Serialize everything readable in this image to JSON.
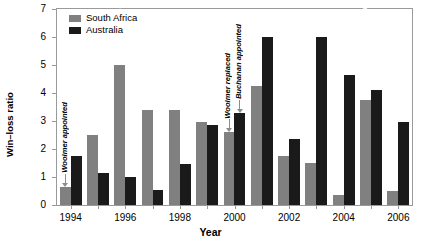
{
  "chart_data": {
    "type": "bar",
    "title": "",
    "xlabel": "Year",
    "ylabel": "Win–loss ratio",
    "ylim": [
      0,
      7
    ],
    "yticks": [
      0,
      1,
      2,
      3,
      4,
      5,
      6,
      7
    ],
    "grid": false,
    "legend_position": "top-left",
    "categories": [
      1994,
      1995,
      1996,
      1997,
      1998,
      1999,
      2000,
      2001,
      2002,
      2003,
      2004,
      2005,
      2006
    ],
    "xtick_labels": [
      "1994",
      "1996",
      "1998",
      "2000",
      "2002",
      "2004",
      "2006"
    ],
    "xtick_categories": [
      1994,
      1996,
      1998,
      2000,
      2002,
      2004,
      2006
    ],
    "series": [
      {
        "name": "South Africa",
        "color": "#808080",
        "values": [
          0.65,
          2.5,
          5.0,
          3.4,
          3.4,
          2.95,
          2.6,
          4.25,
          1.75,
          1.5,
          0.35,
          3.75,
          0.5
        ]
      },
      {
        "name": "Australia",
        "color": "#1a1a1a",
        "values": [
          1.75,
          1.15,
          1.0,
          0.55,
          1.45,
          2.85,
          3.3,
          6.0,
          2.35,
          6.0,
          4.65,
          4.1,
          2.95
        ]
      }
    ],
    "annotations": [
      {
        "id": "woolmer-appointed",
        "text": "Woolmer appointed",
        "category": 1994,
        "style": "dark",
        "arrow": true
      },
      {
        "id": "won-25-of-30",
        "text": "Won 25 out of 30",
        "category": 1996,
        "style": "light",
        "arrow": false
      },
      {
        "id": "woolmer-replaced",
        "text": "Woolmer replaced",
        "category": 2000,
        "style": "dark",
        "arrow": true
      },
      {
        "id": "buchanan-appointed",
        "text": "Buchanan appointed",
        "category": 2000,
        "style": "dark",
        "arrow": true
      },
      {
        "id": "won-18-of-24",
        "text": "Won 18 out of 24, 13 in a row (Zim, WI, NZ)",
        "category": 2005,
        "style": "light",
        "arrow": false
      }
    ]
  }
}
